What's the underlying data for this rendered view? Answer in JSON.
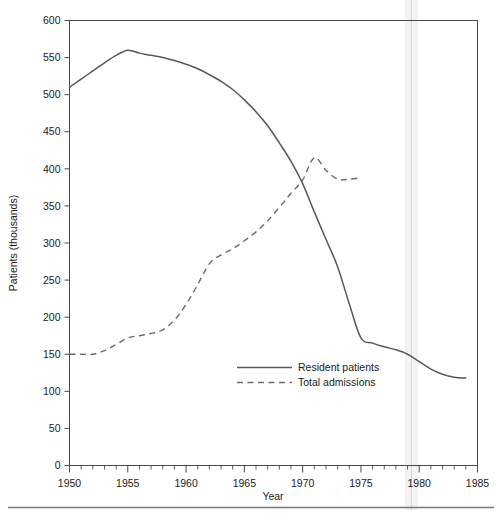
{
  "chart_data": {
    "type": "line",
    "title": "",
    "xlabel": "Year",
    "ylabel": "Patients (thousands)",
    "xlim": [
      1950,
      1985
    ],
    "ylim": [
      0,
      600
    ],
    "xticks": [
      1950,
      1955,
      1960,
      1965,
      1970,
      1975,
      1980,
      1985
    ],
    "xtick_labels": [
      "1950",
      "1955",
      "1960",
      "1965",
      "1970",
      "1975",
      "1980",
      "1985"
    ],
    "xminor_tick_step": 1,
    "yticks": [
      0,
      50,
      100,
      150,
      200,
      250,
      300,
      350,
      400,
      450,
      500,
      550,
      600
    ],
    "ytick_labels": [
      "0",
      "50",
      "100",
      "150",
      "200",
      "250",
      "300",
      "350",
      "400",
      "450",
      "500",
      "550",
      "600"
    ],
    "grid": false,
    "legend_position": "center",
    "series": [
      {
        "name": "Resident patients",
        "style": "solid",
        "color": "#585858",
        "x": [
          1950,
          1951,
          1952,
          1953,
          1954,
          1955,
          1956,
          1957,
          1958,
          1959,
          1960,
          1961,
          1962,
          1963,
          1964,
          1965,
          1966,
          1967,
          1968,
          1969,
          1970,
          1971,
          1972,
          1973,
          1974,
          1975,
          1976,
          1977,
          1978,
          1979,
          1980,
          1981,
          1982,
          1983,
          1984
        ],
        "values": [
          510,
          521,
          532,
          543,
          553,
          560,
          556,
          553,
          550,
          546,
          541,
          535,
          527,
          518,
          507,
          493,
          477,
          458,
          435,
          410,
          380,
          342,
          305,
          268,
          218,
          172,
          165,
          160,
          156,
          150,
          140,
          130,
          123,
          119,
          118
        ]
      },
      {
        "name": "Total admissions",
        "style": "dashed",
        "color": "#6b6b6b",
        "x": [
          1950,
          1951,
          1952,
          1953,
          1954,
          1955,
          1956,
          1957,
          1958,
          1959,
          1960,
          1961,
          1962,
          1963,
          1964,
          1965,
          1966,
          1967,
          1968,
          1969,
          1970,
          1971,
          1972,
          1973,
          1974,
          1975
        ],
        "values": [
          150,
          150,
          150,
          155,
          163,
          172,
          175,
          178,
          183,
          196,
          217,
          244,
          272,
          284,
          292,
          303,
          315,
          330,
          348,
          367,
          385,
          415,
          398,
          386,
          386,
          388
        ]
      }
    ],
    "annotations": []
  },
  "legend": {
    "entries": [
      {
        "label": "Resident patients",
        "style": "solid"
      },
      {
        "label": "Total admissions",
        "style": "dashed"
      }
    ]
  }
}
